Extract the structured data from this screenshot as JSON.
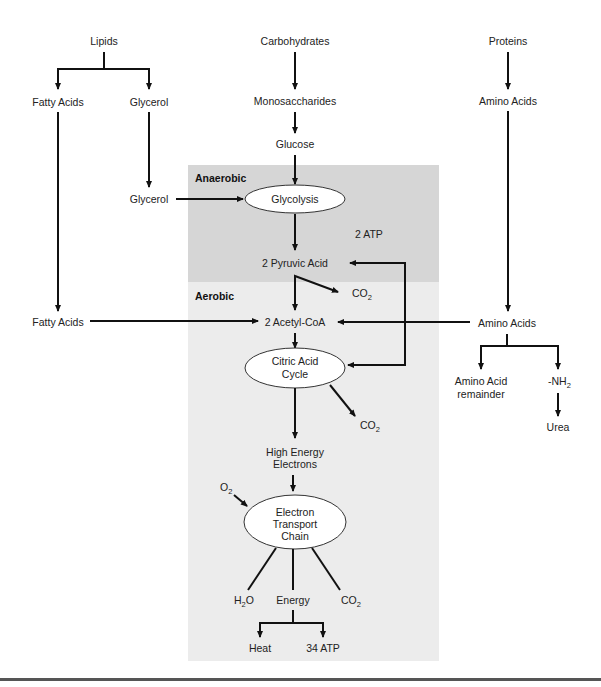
{
  "colors": {
    "anaerobic_zone": "#d6d6d6",
    "aerobic_zone": "#ececec",
    "line": "#111111",
    "rule": "#555555"
  },
  "zones": {
    "anaerobic": "Anaerobic",
    "aerobic": "Aerobic"
  },
  "nodes": {
    "lipids": "Lipids",
    "fatty_acids_top": "Fatty Acids",
    "glycerol_top": "Glycerol",
    "glycerol_mid": "Glycerol",
    "fatty_acids_mid": "Fatty Acids",
    "carbohydrates": "Carbohydrates",
    "monosaccharides": "Monosaccharides",
    "glucose": "Glucose",
    "glycolysis": "Glycolysis",
    "atp_2": "2 ATP",
    "pyruvic_acid": "2 Pyruvic Acid",
    "co2_1": "CO",
    "acetyl_coa": "2 Acetyl-CoA",
    "citric_acid_cycle": [
      "Citric Acid",
      "Cycle"
    ],
    "co2_2": "CO",
    "high_energy_electrons": [
      "High Energy",
      "Electrons"
    ],
    "o2": "O",
    "electron_transport_chain": [
      "Electron",
      "Transport",
      "Chain"
    ],
    "h2o_h": "H",
    "h2o_o": "O",
    "energy": "Energy",
    "co2_3": "CO",
    "heat": "Heat",
    "atp_34": "34 ATP",
    "proteins": "Proteins",
    "amino_acids_top": "Amino Acids",
    "amino_acids_mid": "Amino Acids",
    "amino_acid_remainder": [
      "Amino Acid",
      "remainder"
    ],
    "nh2": "-NH",
    "urea": "Urea",
    "subscript_2": "2"
  }
}
